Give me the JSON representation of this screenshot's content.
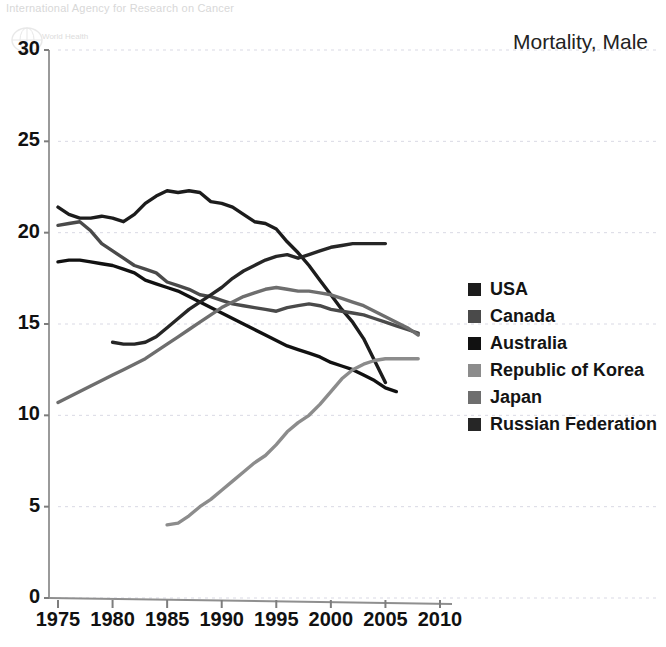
{
  "title": "Mortality, Male",
  "watermark": {
    "agency": "International Agency for Research on Cancer",
    "who": "World Health"
  },
  "axes": {
    "xticks": [
      "1975",
      "1980",
      "1985",
      "1990",
      "1995",
      "2000",
      "2005",
      "2010"
    ],
    "yticks": [
      "0",
      "5",
      "10",
      "15",
      "20",
      "25",
      "30"
    ]
  },
  "legend": {
    "items": [
      {
        "label": "USA",
        "color": "#1c1c1c"
      },
      {
        "label": "Canada",
        "color": "#4a4a4a"
      },
      {
        "label": "Australia",
        "color": "#111111"
      },
      {
        "label": "Republic of Korea",
        "color": "#8c8c8c"
      },
      {
        "label": "Japan",
        "color": "#6e6e6e"
      },
      {
        "label": "Russian Federation",
        "color": "#262626"
      }
    ]
  },
  "chart_data": {
    "type": "line",
    "title": "Mortality, Male",
    "xlabel": "",
    "ylabel": "",
    "xlim": [
      1975,
      2010
    ],
    "ylim": [
      0,
      30
    ],
    "grid": true,
    "legend_position": "right",
    "series": [
      {
        "name": "USA",
        "color": "#1c1c1c",
        "x": [
          1975,
          1976,
          1977,
          1978,
          1979,
          1980,
          1981,
          1982,
          1983,
          1984,
          1985,
          1986,
          1987,
          1988,
          1989,
          1990,
          1991,
          1992,
          1993,
          1994,
          1995,
          1996,
          1997,
          1998,
          1999,
          2000,
          2001,
          2002,
          2003,
          2004,
          2005
        ],
        "values": [
          21.4,
          21.0,
          20.8,
          20.8,
          20.9,
          20.8,
          20.6,
          21.0,
          21.6,
          22.0,
          22.3,
          22.2,
          22.3,
          22.2,
          21.7,
          21.6,
          21.4,
          21.0,
          20.6,
          20.5,
          20.2,
          19.5,
          18.9,
          18.2,
          17.4,
          16.6,
          15.8,
          15.1,
          14.2,
          13.0,
          11.8
        ]
      },
      {
        "name": "Canada",
        "color": "#4a4a4a",
        "x": [
          1975,
          1976,
          1977,
          1978,
          1979,
          1980,
          1981,
          1982,
          1983,
          1984,
          1985,
          1986,
          1987,
          1988,
          1989,
          1990,
          1991,
          1992,
          1993,
          1994,
          1995,
          1996,
          1997,
          1998,
          1999,
          2000,
          2001,
          2002,
          2003,
          2004,
          2005,
          2006,
          2007,
          2008
        ],
        "values": [
          20.4,
          20.5,
          20.6,
          20.1,
          19.4,
          19.0,
          18.6,
          18.2,
          18.0,
          17.8,
          17.3,
          17.1,
          16.9,
          16.6,
          16.5,
          16.3,
          16.1,
          16.0,
          15.9,
          15.8,
          15.7,
          15.9,
          16.0,
          16.1,
          16.0,
          15.8,
          15.7,
          15.6,
          15.5,
          15.3,
          15.1,
          14.9,
          14.7,
          14.5
        ]
      },
      {
        "name": "Australia",
        "color": "#111111",
        "x": [
          1975,
          1976,
          1977,
          1978,
          1979,
          1980,
          1981,
          1982,
          1983,
          1984,
          1985,
          1986,
          1987,
          1988,
          1989,
          1990,
          1991,
          1992,
          1993,
          1994,
          1995,
          1996,
          1997,
          1998,
          1999,
          2000,
          2001,
          2002,
          2003,
          2004,
          2005,
          2006
        ],
        "values": [
          18.4,
          18.5,
          18.5,
          18.4,
          18.3,
          18.2,
          18.0,
          17.8,
          17.4,
          17.2,
          17.0,
          16.8,
          16.5,
          16.2,
          15.9,
          15.6,
          15.3,
          15.0,
          14.7,
          14.4,
          14.1,
          13.8,
          13.6,
          13.4,
          13.2,
          12.9,
          12.7,
          12.5,
          12.2,
          11.9,
          11.5,
          11.3
        ]
      },
      {
        "name": "Republic of Korea",
        "color": "#8c8c8c",
        "x": [
          1985,
          1986,
          1987,
          1988,
          1989,
          1990,
          1991,
          1992,
          1993,
          1994,
          1995,
          1996,
          1997,
          1998,
          1999,
          2000,
          2001,
          2002,
          2003,
          2004,
          2005,
          2006,
          2007,
          2008
        ],
        "values": [
          4.0,
          4.1,
          4.5,
          5.0,
          5.4,
          5.9,
          6.4,
          6.9,
          7.4,
          7.8,
          8.4,
          9.1,
          9.6,
          10.0,
          10.6,
          11.3,
          12.0,
          12.5,
          12.8,
          13.0,
          13.1,
          13.1,
          13.1,
          13.1
        ]
      },
      {
        "name": "Japan",
        "color": "#6e6e6e",
        "x": [
          1975,
          1976,
          1977,
          1978,
          1979,
          1980,
          1981,
          1982,
          1983,
          1984,
          1985,
          1986,
          1987,
          1988,
          1989,
          1990,
          1991,
          1992,
          1993,
          1994,
          1995,
          1996,
          1997,
          1998,
          1999,
          2000,
          2001,
          2002,
          2003,
          2004,
          2005,
          2006,
          2007,
          2008
        ],
        "values": [
          10.7,
          11.0,
          11.3,
          11.6,
          11.9,
          12.2,
          12.5,
          12.8,
          13.1,
          13.5,
          13.9,
          14.3,
          14.7,
          15.1,
          15.5,
          15.9,
          16.2,
          16.5,
          16.7,
          16.9,
          17.0,
          16.9,
          16.8,
          16.8,
          16.7,
          16.6,
          16.4,
          16.2,
          16.0,
          15.7,
          15.4,
          15.1,
          14.8,
          14.4
        ]
      },
      {
        "name": "Russian Federation",
        "color": "#262626",
        "x": [
          1980,
          1981,
          1982,
          1983,
          1984,
          1985,
          1986,
          1987,
          1988,
          1989,
          1990,
          1991,
          1992,
          1993,
          1994,
          1995,
          1996,
          1997,
          1998,
          1999,
          2000,
          2001,
          2002,
          2003,
          2004,
          2005
        ],
        "values": [
          14.0,
          13.9,
          13.9,
          14.0,
          14.3,
          14.8,
          15.3,
          15.8,
          16.2,
          16.6,
          17.0,
          17.5,
          17.9,
          18.2,
          18.5,
          18.7,
          18.8,
          18.6,
          18.8,
          19.0,
          19.2,
          19.3,
          19.4,
          19.4,
          19.4,
          19.4
        ]
      }
    ]
  }
}
